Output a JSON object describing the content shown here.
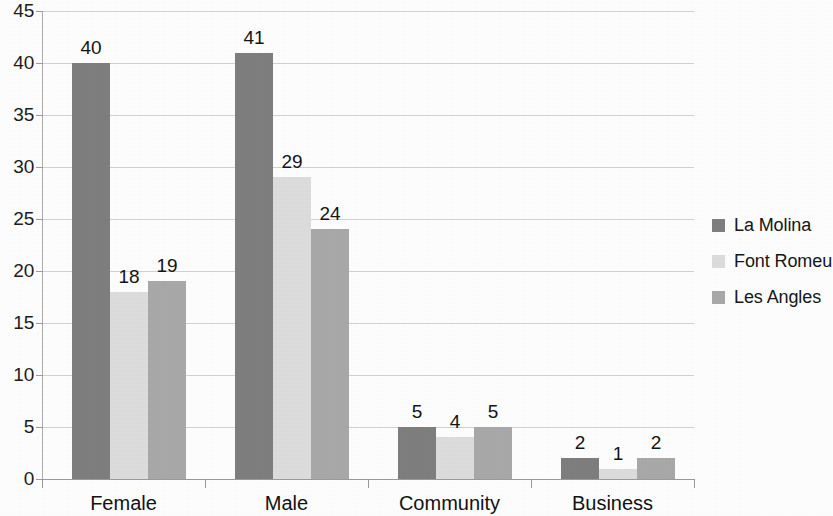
{
  "chart_data": {
    "type": "bar",
    "title": "",
    "subtitle": "",
    "xlabel": "",
    "ylabel": "",
    "categories": [
      "Female",
      "Male",
      "Community",
      "Business"
    ],
    "series": [
      {
        "name": "La Molina",
        "color": "#7e7e7e",
        "values": [
          40,
          41,
          5,
          2
        ]
      },
      {
        "name": "Font Romeu",
        "color": "#dcdcdc",
        "values": [
          18,
          29,
          4,
          1
        ]
      },
      {
        "name": "Les Angles",
        "color": "#a8a8a8",
        "values": [
          19,
          24,
          5,
          2
        ]
      }
    ],
    "ylim": [
      0,
      45
    ],
    "ytick_step": 5,
    "ytick_labels": [
      "45",
      "40",
      "35",
      "30",
      "25",
      "20",
      "15",
      "10",
      "5",
      "0"
    ],
    "ytick_values": [
      45,
      40,
      35,
      30,
      25,
      20,
      15,
      10,
      5,
      0
    ],
    "grid": true,
    "grid_axis": "y",
    "legend_position": "right",
    "data_labels": true,
    "background_color": "#ffffff",
    "gridline_color": "#d2d2d2",
    "axis_color": "#9a9a9a",
    "text_color": "#1a1a1a"
  }
}
